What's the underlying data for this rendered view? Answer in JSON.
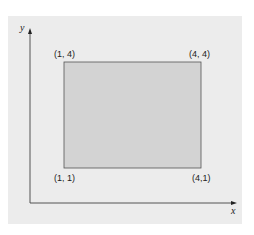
{
  "diagram": {
    "type": "coordinate-plane-rectangle",
    "axes": {
      "x_label": "x",
      "y_label": "y"
    },
    "rectangle": {
      "fill": "#d3d3d3",
      "stroke": "#555555",
      "corners": {
        "top_left": "(1, 4)",
        "top_right": "(4, 4)",
        "bottom_left": "(1, 1)",
        "bottom_right": "(4,1)"
      }
    },
    "background": "#ececec"
  }
}
